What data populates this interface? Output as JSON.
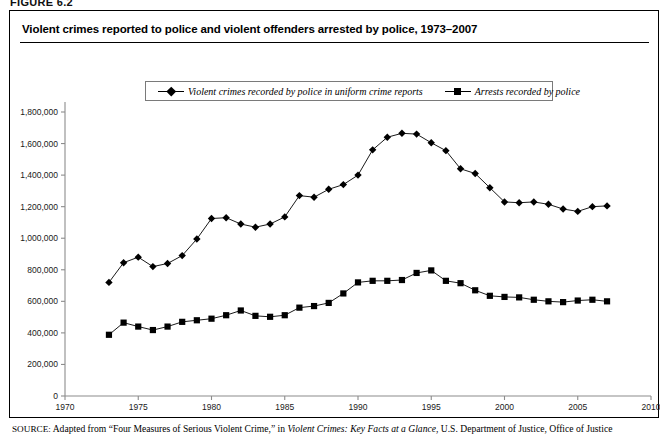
{
  "figure": {
    "label": "FIGURE 6.2",
    "title": "Violent crimes reported to police and violent offenders arrested by police, 1973–2007"
  },
  "legend": {
    "position": "top-center",
    "entries": [
      {
        "marker": "diamond-marker",
        "label": "Violent crimes recorded by police in uniform crime reports"
      },
      {
        "marker": "square-marker",
        "label": "Arrests recorded by police"
      }
    ]
  },
  "source": {
    "keyword": "SOURCE:",
    "text_part1": " Adapted from “Four Measures of Serious Violent Crime,” in ",
    "italic_part": "Violent Crimes: Key Facts at a Glance",
    "text_part2": ", U.S. Department of Justice, Office of Justice"
  },
  "axes": {
    "y_ticks": [
      "0",
      "200,000",
      "400,000",
      "600,000",
      "800,000",
      "1,000,000",
      "1,200,000",
      "1,400,000",
      "1,600,000",
      "1,800,000"
    ],
    "x_ticks": [
      "1970",
      "1975",
      "1980",
      "1985",
      "1990",
      "1995",
      "2000",
      "2005",
      "2010"
    ]
  },
  "chart_data": {
    "type": "line",
    "title": "Violent crimes reported to police and violent offenders arrested by police, 1973–2007",
    "xlabel": "",
    "ylabel": "",
    "xlim": [
      1970,
      2010
    ],
    "ylim": [
      0,
      1800000
    ],
    "grid": false,
    "legend_position": "top-center",
    "x": [
      1973,
      1974,
      1975,
      1976,
      1977,
      1978,
      1979,
      1980,
      1981,
      1982,
      1983,
      1984,
      1985,
      1986,
      1987,
      1988,
      1989,
      1990,
      1991,
      1992,
      1993,
      1994,
      1995,
      1996,
      1997,
      1998,
      1999,
      2000,
      2001,
      2002,
      2003,
      2004,
      2005,
      2006,
      2007
    ],
    "series": [
      {
        "name": "Violent crimes recorded by police in uniform crime reports",
        "marker": "diamond",
        "values": [
          720000,
          845000,
          880000,
          820000,
          840000,
          890000,
          995000,
          1125000,
          1130000,
          1090000,
          1070000,
          1090000,
          1135000,
          1270000,
          1260000,
          1310000,
          1340000,
          1400000,
          1560000,
          1640000,
          1665000,
          1660000,
          1605000,
          1555000,
          1440000,
          1410000,
          1320000,
          1230000,
          1225000,
          1230000,
          1215000,
          1185000,
          1170000,
          1200000,
          1205000
        ]
      },
      {
        "name": "Arrests recorded by police",
        "marker": "square",
        "values": [
          388000,
          465000,
          440000,
          418000,
          440000,
          470000,
          480000,
          490000,
          512000,
          542000,
          508000,
          502000,
          512000,
          560000,
          570000,
          590000,
          650000,
          720000,
          730000,
          730000,
          735000,
          780000,
          796000,
          730000,
          715000,
          670000,
          635000,
          628000,
          625000,
          610000,
          600000,
          595000,
          605000,
          610000,
          600000
        ]
      }
    ]
  }
}
